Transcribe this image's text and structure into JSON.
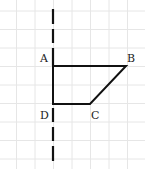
{
  "diagram": {
    "type": "geometry-figure",
    "grid": {
      "color": "#e6e6e6",
      "spacing": 18.5,
      "x0": 16.5,
      "y0": 11
    },
    "axis_of_symmetry": {
      "style": "dashed",
      "x": 53,
      "y_top": 8,
      "y_bottom": 162,
      "color": "#111111"
    },
    "shape": {
      "name": "ABCD",
      "stroke": "#111111",
      "vertices": [
        {
          "id": "A",
          "x": 53,
          "y": 66
        },
        {
          "id": "B",
          "x": 126,
          "y": 66
        },
        {
          "id": "C",
          "x": 90,
          "y": 104
        },
        {
          "id": "D",
          "x": 53,
          "y": 104
        }
      ]
    },
    "labels": {
      "A": "A",
      "B": "B",
      "C": "C",
      "D": "D"
    }
  }
}
